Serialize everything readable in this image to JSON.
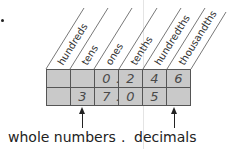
{
  "columns": [
    {
      "label": "hundreds"
    },
    {
      "label": "tens"
    },
    {
      "label": "ones"
    },
    {
      "label": "tenths"
    },
    {
      "label": "hundredths"
    },
    {
      "label": "thousandths"
    }
  ],
  "rows": [
    {
      "cells": [
        "",
        "",
        "0",
        "2",
        "4",
        "6"
      ],
      "decimal_point": "."
    },
    {
      "cells": [
        "",
        "3",
        "7",
        "0",
        "5",
        ""
      ],
      "decimal_point": "."
    }
  ],
  "labels": {
    "whole": "whole numbers",
    "point": ".",
    "decimals": "decimals"
  },
  "colors": {
    "cell_fill": "#c9c9c9",
    "grid_line": "#555555",
    "digit": "#4a4a4a"
  }
}
